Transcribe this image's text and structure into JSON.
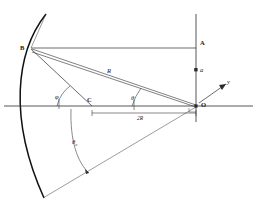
{
  "figure": {
    "background_color": "#ffffff",
    "line_color": "#2b2b2b",
    "arc_color": "#111111",
    "width": 257,
    "height": 207
  },
  "labels": {
    "point_b": "B",
    "point_a": "A",
    "point_c": "C",
    "point_o": "O",
    "axis_y": "y",
    "radius_r": "R",
    "offset_a": "a",
    "angle_phi": "φ",
    "angle_theta": "θ",
    "angle_theta_zero": "θ",
    "angle_theta_zero_sub": "o",
    "dimension_2r_prefix": "2",
    "dimension_2r_symbol": "R"
  },
  "geometry": {
    "origin": {
      "x": 196,
      "y": 106
    },
    "point_b": {
      "x": 31,
      "y": 48
    },
    "point_c": {
      "x": 92,
      "y": 106
    },
    "point_a": {
      "x": 196,
      "y": 48
    },
    "vertical_axis_top": {
      "x": 196,
      "y": 14
    },
    "vertical_axis_bottom": {
      "x": 196,
      "y": 122
    },
    "horizontal_axis_left": {
      "x": 4,
      "y": 106
    },
    "horizontal_axis_right": {
      "x": 253,
      "y": 106
    },
    "arc_start": {
      "x": 46,
      "y": 14
    },
    "arc_end": {
      "x": 44,
      "y": 198
    },
    "lower_ray_end": {
      "x": 43,
      "y": 198
    },
    "angle_marker_radius": 62
  }
}
